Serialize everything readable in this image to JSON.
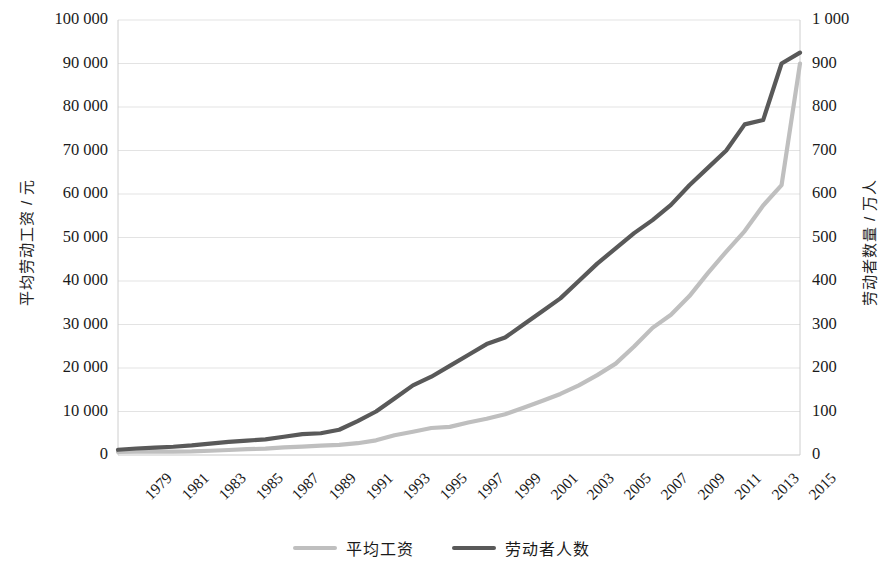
{
  "chart_data": {
    "type": "line",
    "title": "",
    "subtitle": "",
    "xlabel": "",
    "ylabel": "平均劳动工资 / 元",
    "y2label": "劳动者数量 / 万人",
    "grid": true,
    "legend_position": "bottom",
    "ylim": [
      0,
      100000
    ],
    "y2lim": [
      0,
      1000
    ],
    "ytick_labels": [
      "100 000",
      "90 000",
      "80 000",
      "70 000",
      "60 000",
      "50 000",
      "40 000",
      "30 000",
      "20 000",
      "10 000",
      "0"
    ],
    "ytick_values": [
      100000,
      90000,
      80000,
      70000,
      60000,
      50000,
      40000,
      30000,
      20000,
      10000,
      0
    ],
    "y2tick_labels": [
      "1 000",
      "900",
      "800",
      "700",
      "600",
      "500",
      "400",
      "300",
      "200",
      "100",
      "0"
    ],
    "y2tick_values": [
      1000,
      900,
      800,
      700,
      600,
      500,
      400,
      300,
      200,
      100,
      0
    ],
    "xlim": [
      1979,
      2016
    ],
    "xtick_labels": [
      "1979",
      "1981",
      "1983",
      "1985",
      "1987",
      "1989",
      "1991",
      "1993",
      "1995",
      "1997",
      "1999",
      "2001",
      "2003",
      "2005",
      "2007",
      "2009",
      "2011",
      "2013",
      "2015"
    ],
    "x": [
      1979,
      1980,
      1981,
      1982,
      1983,
      1984,
      1985,
      1986,
      1987,
      1988,
      1989,
      1990,
      1991,
      1992,
      1993,
      1994,
      1995,
      1996,
      1997,
      1998,
      1999,
      2000,
      2001,
      2002,
      2003,
      2004,
      2005,
      2006,
      2007,
      2008,
      2009,
      2010,
      2011,
      2012,
      2013,
      2014,
      2015,
      2016
    ],
    "series": [
      {
        "name": "平均工资",
        "axis": "left",
        "unit": "元",
        "color": "#bfbfbf",
        "values": [
          705,
          762,
          772,
          798,
          826,
          974,
          1148,
          1329,
          1459,
          1747,
          1935,
          2140,
          2340,
          2711,
          3371,
          4538,
          5348,
          6210,
          6470,
          7479,
          8346,
          9371,
          10870,
          12422,
          14040,
          16024,
          18364,
          21001,
          24932,
          29229,
          32244,
          36539,
          41799,
          46769,
          51483,
          57361,
          62029,
          90000
        ]
      },
      {
        "name": "劳动者人数",
        "axis": "right",
        "unit": "万人",
        "color": "#595959",
        "values": [
          12,
          15,
          17,
          19,
          22,
          26,
          30,
          33,
          36,
          42,
          48,
          50,
          58,
          78,
          100,
          130,
          160,
          180,
          205,
          230,
          255,
          270,
          300,
          330,
          360,
          400,
          440,
          475,
          510,
          540,
          575,
          620,
          660,
          700,
          760,
          770,
          900,
          925
        ]
      }
    ]
  },
  "legend": {
    "items": [
      {
        "label": "平均工资",
        "color": "#bfbfbf"
      },
      {
        "label": "劳动者人数",
        "color": "#595959"
      }
    ]
  },
  "plot": {
    "left": 118,
    "right": 800,
    "top": 20,
    "bottom": 455,
    "grid_color": "#dcdcdc",
    "axis_color": "#c8c8c8"
  }
}
